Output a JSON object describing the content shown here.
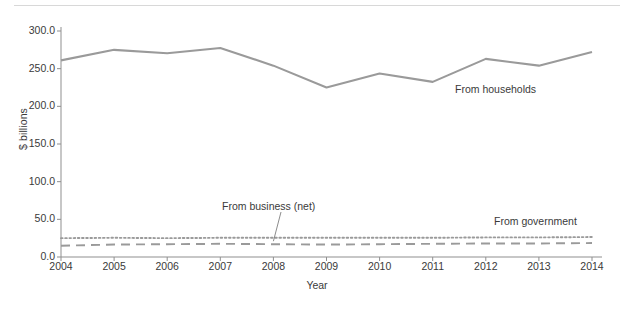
{
  "chart_data": {
    "type": "line",
    "title": "",
    "subtitle": "",
    "xlabel": "Year",
    "ylabel": "$ billions",
    "grid": false,
    "legend_position": "inline-annotations",
    "x": [
      2004,
      2005,
      2006,
      2007,
      2008,
      2009,
      2010,
      2011,
      2012,
      2013,
      2014
    ],
    "xtick_labels": [
      "2004",
      "2005",
      "2006",
      "2007",
      "2008",
      "2009",
      "2010",
      "2011",
      "2012",
      "2013",
      "2014"
    ],
    "ytick_labels": [
      "0.0",
      "50.0",
      "100.0",
      "150.0",
      "200.0",
      "250.0",
      "300.0"
    ],
    "ytick_values": [
      0.0,
      50.0,
      100.0,
      150.0,
      200.0,
      250.0,
      300.0
    ],
    "xlim": [
      2004,
      2014
    ],
    "ylim": [
      0.0,
      300.0
    ],
    "series": [
      {
        "name": "From households",
        "style": "solid",
        "color": "#9a9a9a",
        "annotation": "From households",
        "values": [
          261.0,
          275.0,
          270.5,
          277.5,
          254.0,
          225.0,
          243.5,
          232.5,
          263.0,
          254.0,
          272.0
        ]
      },
      {
        "name": "From government",
        "style": "dotted",
        "color": "#9a9a9a",
        "annotation": "From government",
        "values": [
          25.0,
          25.5,
          25.0,
          25.5,
          25.5,
          25.5,
          25.5,
          25.5,
          26.0,
          26.0,
          26.5
        ]
      },
      {
        "name": "From business (net)",
        "style": "dashed",
        "color": "#9a9a9a",
        "annotation": "From business (net)",
        "values": [
          15.0,
          16.5,
          17.0,
          17.5,
          17.0,
          16.5,
          17.0,
          17.5,
          18.0,
          18.0,
          18.5
        ]
      }
    ]
  },
  "axis": {
    "ylabel_text": "$ billions",
    "xlabel_text": "Year"
  },
  "annotations": {
    "households": "From households",
    "business": "From business (net)",
    "government": "From government"
  },
  "colors": {
    "line": "#9a9a9a",
    "axis": "#8f8f8f",
    "text": "#3a3a3a",
    "rule": "#d8d8d8",
    "background": "#ffffff"
  }
}
